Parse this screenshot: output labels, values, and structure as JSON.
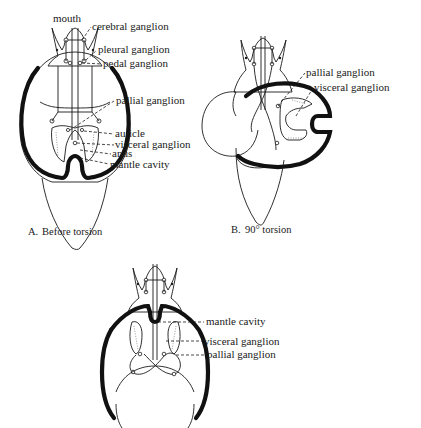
{
  "figure": {
    "panels": [
      {
        "id": "A",
        "caption_letter": "A.",
        "caption_text": "Before torsion",
        "labels": {
          "mouth": "mouth",
          "cerebral": "cerebral ganglion",
          "pleural": "pleural ganglion",
          "pedal": "pedal ganglion",
          "pallial": "pallial ganglion",
          "auricle": "auricle",
          "visceral": "visceral ganglion",
          "anus": "anus",
          "mantle": "mantle cavity"
        }
      },
      {
        "id": "B",
        "caption_letter": "B.",
        "caption_text": "90° torsion",
        "labels": {
          "pallial": "pallial ganglion",
          "visceral": "visceral ganglion"
        }
      },
      {
        "id": "C",
        "labels": {
          "mantle": "mantle cavity",
          "visceral": "visceral ganglion",
          "pallial": "pallial ganglion"
        }
      }
    ]
  }
}
